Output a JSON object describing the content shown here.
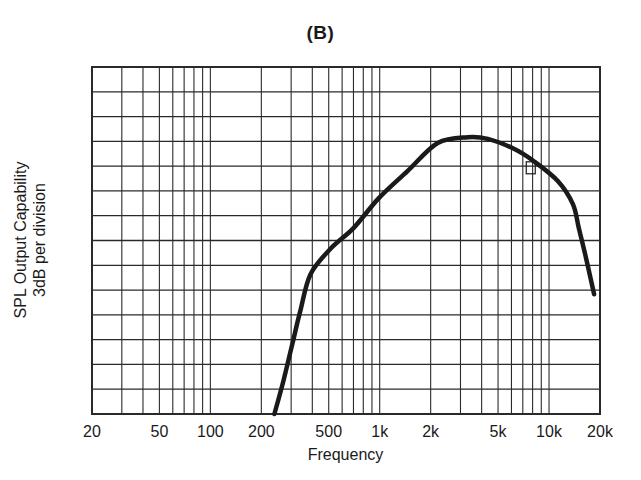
{
  "chart_data": {
    "type": "line",
    "title": "(B)",
    "xlabel": "Frequency",
    "ylabel": [
      "SPL Output Capability",
      "3dB per division"
    ],
    "x_scale": "log",
    "xlim": [
      20,
      20000
    ],
    "ylim_divisions": [
      0,
      14
    ],
    "db_per_division": 3,
    "ylim_db": [
      0,
      42
    ],
    "grid": true,
    "legend": null,
    "x_tick_labels": [
      {
        "value": 20,
        "label": "20"
      },
      {
        "value": 50,
        "label": "50"
      },
      {
        "value": 100,
        "label": "100"
      },
      {
        "value": 200,
        "label": "200"
      },
      {
        "value": 500,
        "label": "500"
      },
      {
        "value": 1000,
        "label": "1k"
      },
      {
        "value": 2000,
        "label": "2k"
      },
      {
        "value": 5000,
        "label": "5k"
      },
      {
        "value": 10000,
        "label": "10k"
      },
      {
        "value": 20000,
        "label": "20k"
      }
    ],
    "x_gridlines": [
      30,
      40,
      50,
      60,
      70,
      80,
      90,
      100,
      200,
      300,
      400,
      500,
      600,
      700,
      800,
      900,
      1000,
      2000,
      3000,
      4000,
      5000,
      6000,
      7000,
      8000,
      9000,
      10000
    ],
    "series": [
      {
        "name": "SPL Output Capability",
        "x": [
          239,
          270,
          305,
          340,
          390,
          512,
          700,
          985,
          1460,
          2200,
          3310,
          4350,
          6200,
          8130,
          11270,
          13840,
          15000,
          16540,
          18450
        ],
        "y_db": [
          0.0,
          4.0,
          8.5,
          12.5,
          16.9,
          20.0,
          22.5,
          26.1,
          29.4,
          32.8,
          33.5,
          33.3,
          32.1,
          30.6,
          28.2,
          25.4,
          22.5,
          18.9,
          14.5
        ]
      }
    ],
    "annotations": [
      {
        "type": "small-square-marker",
        "x": 7800,
        "y_db": 29.8
      }
    ]
  },
  "colors": {
    "line": "#1a1a1a",
    "grid": "#2a2a2a",
    "background": "#ffffff"
  }
}
